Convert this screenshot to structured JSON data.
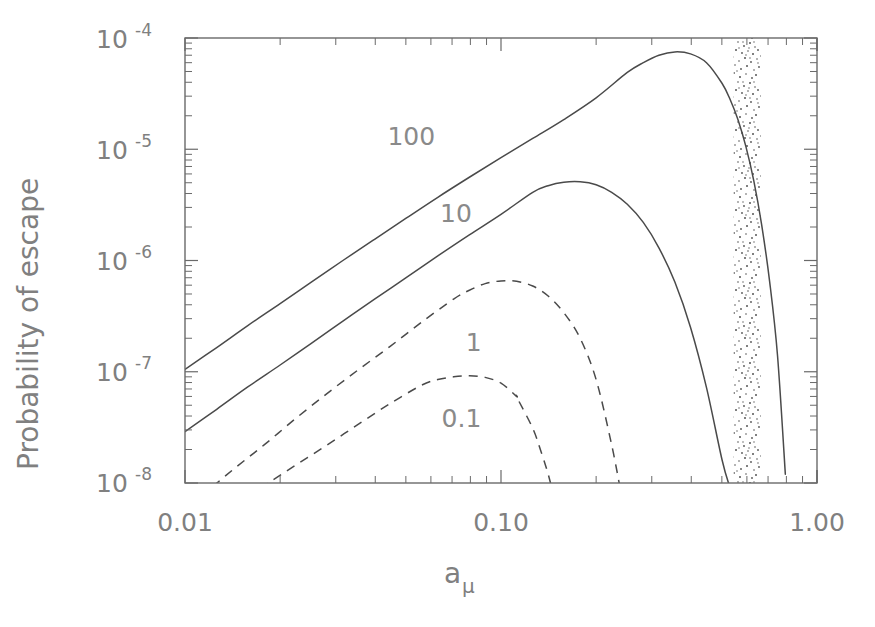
{
  "chart_data": {
    "type": "line",
    "title": "",
    "xlabel": "a_mu",
    "xlabel_base": "a",
    "xlabel_subscript": "μ",
    "ylabel": "Probability of escape",
    "xscale": "log",
    "yscale": "log",
    "xlim": [
      0.01,
      1.0
    ],
    "ylim": [
      1e-08,
      0.0001
    ],
    "grid": false,
    "legend_position": "inline-curve-labels",
    "xticklabels": [
      "0.01",
      "0.10",
      "1.00"
    ],
    "xtickvalues": [
      0.01,
      0.1,
      1.0
    ],
    "yticklabels": [
      "10−4",
      "10−5",
      "10−6",
      "10−7",
      "10−8"
    ],
    "ytickmantissa": "10",
    "ytickexponents": [
      "-4",
      "-5",
      "-6",
      "-7",
      "-8"
    ],
    "ytickvalues": [
      0.0001,
      1e-05,
      1e-06,
      1e-07,
      1e-08
    ],
    "annotations": [
      {
        "text": "100",
        "x": 0.052,
        "y": 1.1e-05,
        "curve": "100"
      },
      {
        "text": "10",
        "x": 0.072,
        "y": 2.2e-06,
        "curve": "10"
      },
      {
        "text": "1",
        "x": 0.082,
        "y": 1.55e-07,
        "curve": "1"
      },
      {
        "text": "0.1",
        "x": 0.075,
        "y": 3.2e-08,
        "curve": "0.1"
      }
    ],
    "shaded_band": {
      "label": "stippled-resonance-band",
      "x_start": 0.545,
      "x_end": 0.665,
      "style": "stipple"
    },
    "series": [
      {
        "name": "100",
        "style": "solid",
        "peak_x": 0.35,
        "peak_y": 7.5e-05,
        "x": [
          0.01,
          0.0126,
          0.0158,
          0.02,
          0.0251,
          0.0316,
          0.0398,
          0.0501,
          0.0631,
          0.0794,
          0.1,
          0.126,
          0.158,
          0.2,
          0.251,
          0.282,
          0.316,
          0.355,
          0.398,
          0.447,
          0.501,
          0.531,
          0.562,
          0.596,
          0.631,
          0.668,
          0.708,
          0.75,
          0.794
        ],
        "y": [
          1.05e-07,
          1.65e-07,
          2.6e-07,
          4.1e-07,
          6.4e-07,
          1e-06,
          1.55e-06,
          2.4e-06,
          3.7e-06,
          5.6e-06,
          8.4e-06,
          1.25e-05,
          1.85e-05,
          2.9e-05,
          4.9e-05,
          6e-05,
          7e-05,
          7.5e-05,
          7.2e-05,
          6e-05,
          3.9e-05,
          2.8e-05,
          1.85e-05,
          1.05e-05,
          5.2e-06,
          2.1e-06,
          6.5e-07,
          1.4e-07,
          1.2e-08
        ]
      },
      {
        "name": "10",
        "style": "solid",
        "peak_x": 0.17,
        "peak_y": 5.1e-06,
        "x": [
          0.01,
          0.0126,
          0.0158,
          0.02,
          0.0251,
          0.0316,
          0.0398,
          0.0501,
          0.0631,
          0.0794,
          0.1,
          0.126,
          0.141,
          0.158,
          0.178,
          0.2,
          0.224,
          0.251,
          0.282,
          0.316,
          0.355,
          0.398,
          0.447,
          0.501,
          0.531,
          0.562
        ],
        "y": [
          2.9e-08,
          4.6e-08,
          7.3e-08,
          1.15e-07,
          1.8e-07,
          2.85e-07,
          4.5e-07,
          7e-07,
          1.1e-06,
          1.7e-06,
          2.6e-06,
          4.1e-06,
          4.7e-06,
          5.05e-06,
          5.1e-06,
          4.8e-06,
          4.1e-06,
          3.2e-06,
          2.2e-06,
          1.3e-06,
          6.4e-07,
          2.5e-07,
          7.2e-08,
          1.6e-08,
          9e-09,
          5.5e-09
        ]
      },
      {
        "name": "1",
        "style": "dashed",
        "peak_x": 0.115,
        "peak_y": 6.6e-07,
        "x": [
          0.0112,
          0.0141,
          0.0178,
          0.0224,
          0.0282,
          0.0355,
          0.0447,
          0.0562,
          0.0708,
          0.0794,
          0.0891,
          0.1,
          0.112,
          0.126,
          0.141,
          0.158,
          0.178,
          0.2,
          0.224,
          0.24
        ],
        "y": [
          7.5e-09,
          1.3e-08,
          2.2e-08,
          3.8e-08,
          6.4e-08,
          1.05e-07,
          1.7e-07,
          2.8e-07,
          4.5e-07,
          5.4e-07,
          6.2e-07,
          6.55e-07,
          6.5e-07,
          5.9e-07,
          4.8e-07,
          3.4e-07,
          2e-07,
          8.5e-08,
          2.2e-08,
          8e-09
        ]
      },
      {
        "name": "0.1",
        "style": "dashed",
        "peak_x": 0.088,
        "peak_y": 9.2e-08,
        "x": [
          0.0141,
          0.0178,
          0.0224,
          0.0282,
          0.0355,
          0.0447,
          0.0562,
          0.0631,
          0.0708,
          0.0794,
          0.0891,
          0.1,
          0.112,
          0.1122,
          0.126,
          0.134,
          0.141,
          0.148
        ],
        "y": [
          6.5e-09,
          9.5e-09,
          1.45e-08,
          2.2e-08,
          3.4e-08,
          5.2e-08,
          7.6e-08,
          8.5e-08,
          9e-08,
          9.2e-08,
          8.9e-08,
          7.9e-08,
          6e-08,
          5.9e-08,
          3.1e-08,
          1.9e-08,
          1.2e-08,
          7e-09
        ]
      }
    ]
  }
}
